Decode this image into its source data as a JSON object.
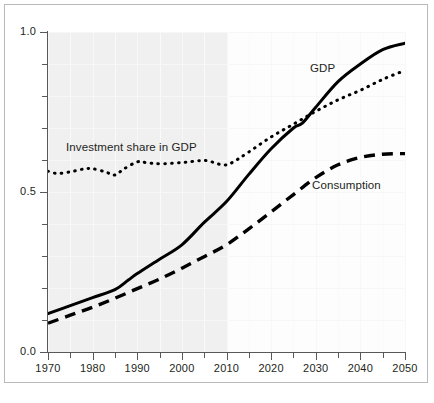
{
  "chart_data": {
    "type": "line",
    "title": "",
    "subtitle": "",
    "xlabel": "",
    "ylabel": "",
    "xlim": [
      1970,
      2050
    ],
    "ylim": [
      0.0,
      1.0
    ],
    "grid": true,
    "legend_position": "inline-annotations",
    "x_tick_labels": [
      "1970",
      "1980",
      "1990",
      "2000",
      "2010",
      "2020",
      "2030",
      "2040",
      "2050"
    ],
    "x_major_ticks": [
      1970,
      1980,
      1990,
      2000,
      2010,
      2020,
      2030,
      2040,
      2050
    ],
    "x_minor_ticks": [
      1975,
      1985,
      1995,
      2005,
      2015,
      2025,
      2035,
      2045
    ],
    "y_tick_labels": [
      "1.0",
      "0.5",
      "0.0"
    ],
    "y_major_ticks": [
      0.0,
      0.5,
      1.0
    ],
    "y_minor_ticks": [
      0.1,
      0.2,
      0.3,
      0.4,
      0.6,
      0.7,
      0.8,
      0.9
    ],
    "shaded_region": {
      "label": "historical",
      "from": 1970,
      "to": 2010
    },
    "series": [
      {
        "name": "GDP",
        "style": "solid",
        "color": "#000000",
        "x": [
          1970,
          1975,
          1980,
          1985,
          1988,
          1990,
          1995,
          2000,
          2005,
          2010,
          2015,
          2020,
          2025,
          2027,
          2030,
          2035,
          2040,
          2045,
          2050
        ],
        "values": [
          0.12,
          0.145,
          0.17,
          0.195,
          0.225,
          0.245,
          0.29,
          0.335,
          0.405,
          0.47,
          0.555,
          0.635,
          0.7,
          0.715,
          0.765,
          0.845,
          0.9,
          0.945,
          0.965
        ]
      },
      {
        "name": "Investment share in GDP",
        "style": "dotted",
        "color": "#000000",
        "x": [
          1970,
          1972,
          1975,
          1978,
          1980,
          1983,
          1985,
          1987,
          1990,
          1992,
          1995,
          2000,
          2004,
          2006,
          2008,
          2010,
          2012,
          2015,
          2020,
          2025,
          2030,
          2035,
          2040,
          2045,
          2050
        ],
        "values": [
          0.565,
          0.558,
          0.563,
          0.572,
          0.573,
          0.562,
          0.553,
          0.572,
          0.594,
          0.592,
          0.588,
          0.592,
          0.598,
          0.597,
          0.588,
          0.585,
          0.598,
          0.625,
          0.672,
          0.712,
          0.752,
          0.788,
          0.818,
          0.852,
          0.88
        ]
      },
      {
        "name": "Consumption",
        "style": "dashed",
        "color": "#000000",
        "x": [
          1970,
          1975,
          1980,
          1985,
          1990,
          1995,
          2000,
          2005,
          2010,
          2015,
          2020,
          2025,
          2030,
          2035,
          2040,
          2045,
          2050
        ],
        "values": [
          0.09,
          0.115,
          0.14,
          0.168,
          0.198,
          0.228,
          0.262,
          0.298,
          0.335,
          0.385,
          0.438,
          0.492,
          0.545,
          0.585,
          0.608,
          0.618,
          0.62
        ]
      }
    ],
    "annotations": [
      {
        "text": "Investment share in GDP",
        "series": "Investment share in GDP"
      },
      {
        "text": "GDP",
        "series": "GDP"
      },
      {
        "text": "Consumption",
        "series": "Consumption"
      }
    ],
    "colors": {
      "line": "#000000",
      "axis": "#58585a",
      "text": "#231f20",
      "plot_background_historical": "#f0f0f0",
      "plot_background_projection": "#fdfdfd",
      "grid": "#fafafa",
      "frame_border": "#b9b9b9",
      "page_background": "#ffffff"
    }
  }
}
